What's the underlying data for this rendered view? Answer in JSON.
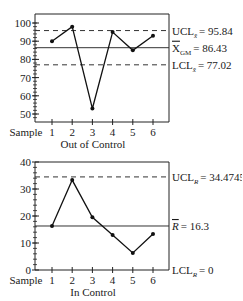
{
  "chart_data": [
    {
      "type": "line",
      "title": "",
      "xlabel": "Out of Control",
      "x_prefix_label": "Sample",
      "ylabel": "",
      "categories": [
        "1",
        "2",
        "3",
        "4",
        "5",
        "6"
      ],
      "x": [
        1,
        2,
        3,
        4,
        5,
        6
      ],
      "values": [
        90,
        98,
        53,
        95,
        85,
        93
      ],
      "ylim": [
        45,
        105
      ],
      "yticks": [
        50,
        60,
        70,
        80,
        90,
        100
      ],
      "ytick_labels": [
        "50",
        "60",
        "70",
        "80",
        "90",
        "100"
      ],
      "grid": false,
      "reference_lines": [
        {
          "name": "UCL",
          "value": 95.84,
          "style": "dashed",
          "label_main": "UCL",
          "label_sub": "x̄",
          "label_value": "= 95.84"
        },
        {
          "name": "center",
          "value": 86.43,
          "style": "solid",
          "label_main": "X",
          "label_sub": "GM",
          "label_value": "= 86.43",
          "overline": true
        },
        {
          "name": "LCL",
          "value": 77.02,
          "style": "dashed",
          "label_main": "LCL",
          "label_sub": "x̄",
          "label_value": "= 77.02"
        }
      ]
    },
    {
      "type": "line",
      "title": "",
      "xlabel": "In Control",
      "x_prefix_label": "Sample",
      "ylabel": "",
      "categories": [
        "1",
        "2",
        "3",
        "4",
        "5",
        "6"
      ],
      "x": [
        1,
        2,
        3,
        4,
        5,
        6
      ],
      "values": [
        16.3,
        33.3,
        19.5,
        13.0,
        6.3,
        13.3
      ],
      "ylim": [
        0,
        40
      ],
      "yticks": [
        0,
        10,
        20,
        30,
        40
      ],
      "ytick_labels": [
        "0",
        "10",
        "20",
        "30",
        "40"
      ],
      "grid": false,
      "reference_lines": [
        {
          "name": "UCL",
          "value": 34.4745,
          "style": "dashed",
          "label_main": "UCL",
          "label_sub": "R",
          "label_value": "= 34.4745"
        },
        {
          "name": "center",
          "value": 16.3,
          "style": "solid",
          "label_main": "R",
          "label_sub": "",
          "label_value": "= 16.3",
          "overline": true,
          "italic": true
        },
        {
          "name": "LCL",
          "value": 0,
          "style": "axis",
          "label_main": "LCL",
          "label_sub": "R",
          "label_value": "= 0"
        }
      ]
    }
  ]
}
